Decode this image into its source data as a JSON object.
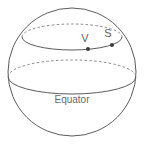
{
  "figure": {
    "name": "sphere-with-latitude-circle",
    "canvas": {
      "width": 145,
      "height": 146,
      "background": "#ffffff"
    },
    "colors": {
      "outline": "#5b5b5b",
      "hidden_line": "#8a8a8a",
      "point": "#3a3a3a",
      "label_text": "#5e5e5e"
    },
    "sphere": {
      "cx": 72,
      "cy": 72,
      "r": 64
    },
    "equator": {
      "label": "Equator",
      "cx": 72,
      "cy": 77,
      "rx": 64,
      "ry": 17,
      "front_style": "solid",
      "back_style": "dashed",
      "label_x": 72,
      "label_y": 103
    },
    "latitude_circle": {
      "cx": 72,
      "cy": 37,
      "rx": 50,
      "ry": 13,
      "front_style": "solid",
      "back_style": "dashed"
    },
    "points": [
      {
        "label": "V",
        "dot_x": 88,
        "dot_y": 49,
        "label_x": 85,
        "label_y": 42,
        "dot_r": 2
      },
      {
        "label": "S",
        "dot_x": 112,
        "dot_y": 45,
        "label_x": 108,
        "label_y": 37,
        "dot_r": 2
      }
    ]
  }
}
